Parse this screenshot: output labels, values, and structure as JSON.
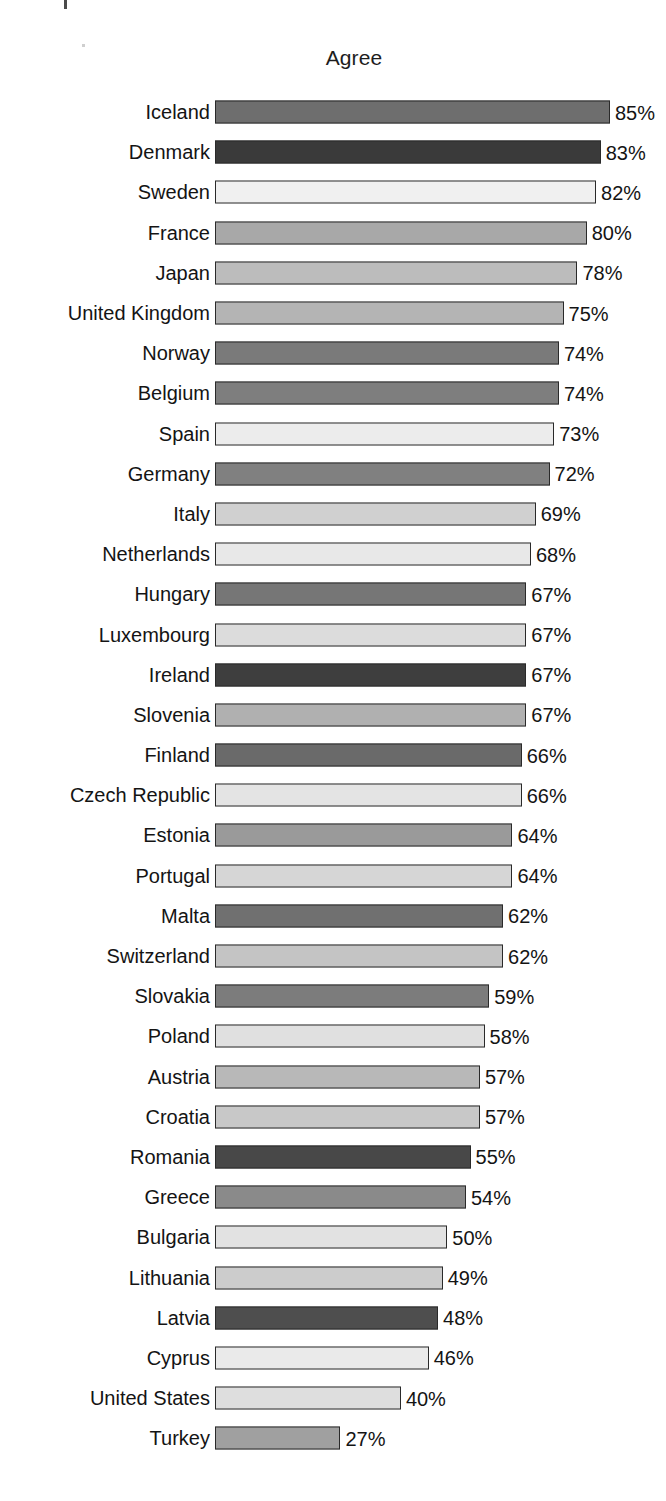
{
  "chart_data": {
    "type": "bar",
    "orientation": "horizontal",
    "title": "Agree",
    "xlabel": "",
    "ylabel": "",
    "xlim": [
      0,
      90
    ],
    "grid": false,
    "legend": null,
    "value_suffix": "%",
    "categories": [
      "Iceland",
      "Denmark",
      "Sweden",
      "France",
      "Japan",
      "United Kingdom",
      "Norway",
      "Belgium",
      "Spain",
      "Germany",
      "Italy",
      "Netherlands",
      "Hungary",
      "Luxembourg",
      "Ireland",
      "Slovenia",
      "Finland",
      "Czech Republic",
      "Estonia",
      "Portugal",
      "Malta",
      "Switzerland",
      "Slovakia",
      "Poland",
      "Austria",
      "Croatia",
      "Romania",
      "Greece",
      "Bulgaria",
      "Lithuania",
      "Latvia",
      "Cyprus",
      "United States",
      "Turkey"
    ],
    "values": [
      85,
      83,
      82,
      80,
      78,
      75,
      74,
      74,
      73,
      72,
      69,
      68,
      67,
      67,
      67,
      67,
      66,
      66,
      64,
      64,
      62,
      62,
      59,
      58,
      57,
      57,
      55,
      54,
      50,
      49,
      48,
      46,
      40,
      27
    ],
    "value_labels": [
      "85%",
      "83%",
      "82%",
      "80%",
      "78%",
      "75%",
      "74%",
      "74%",
      "73%",
      "72%",
      "69%",
      "68%",
      "67%",
      "67%",
      "67%",
      "67%",
      "66%",
      "66%",
      "64%",
      "64%",
      "62%",
      "62%",
      "59%",
      "58%",
      "57%",
      "57%",
      "55%",
      "54%",
      "50%",
      "49%",
      "48%",
      "46%",
      "40%",
      "27%"
    ],
    "bar_colors": [
      "#6e6e6e",
      "#3a3a3a",
      "#f0f0f0",
      "#a8a8a8",
      "#bcbcbc",
      "#b4b4b4",
      "#7a7a7a",
      "#7e7e7e",
      "#ececec",
      "#808080",
      "#d0d0d0",
      "#e8e8e8",
      "#767676",
      "#dcdcdc",
      "#3e3e3e",
      "#b0b0b0",
      "#6a6a6a",
      "#e4e4e4",
      "#9a9a9a",
      "#d6d6d6",
      "#707070",
      "#c4c4c4",
      "#7c7c7c",
      "#e0e0e0",
      "#b8b8b8",
      "#c8c8c8",
      "#484848",
      "#8a8a8a",
      "#e2e2e2",
      "#cccccc",
      "#4e4e4e",
      "#eaeaea",
      "#dedede",
      "#a0a0a0"
    ],
    "bar_outline_color": "#2a2a2a"
  }
}
